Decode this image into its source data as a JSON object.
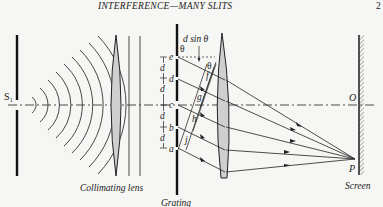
{
  "header": {
    "running_title": "INTERFERENCE—MANY SLITS",
    "page_number": "2"
  },
  "diagram": {
    "source_label": "S₁",
    "collimating_lens_label": "Collimating lens",
    "grating_label": "Grating",
    "screen_label": "Screen",
    "path_difference_label": "d sin θ",
    "theta_label": "θ",
    "spacing_label": "d",
    "slit_labels": [
      "e",
      "d",
      "c",
      "b",
      "a"
    ],
    "foot_labels": [
      "f",
      "g",
      "h",
      "j"
    ],
    "center_point_label": "O",
    "focus_point_label": "P",
    "colors": {
      "ink": "#222222",
      "lens_fill": "#cfcfcf",
      "background": "#f6f6f4"
    }
  }
}
